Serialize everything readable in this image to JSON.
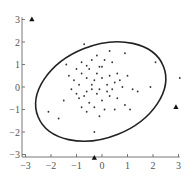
{
  "chart_data": {
    "type": "scatter",
    "title": "",
    "xlabel": "",
    "ylabel": "",
    "xlim": [
      -3.1,
      3.1
    ],
    "ylim": [
      -3.2,
      3.1
    ],
    "grid": false,
    "x_ticks": [
      -3,
      -2,
      -1,
      0,
      1,
      2,
      3
    ],
    "y_ticks": [
      -3,
      -2,
      -1,
      0,
      1,
      2,
      3
    ],
    "x_tick_labels": [
      "−3",
      "−2",
      "−1",
      "0",
      "1",
      "2",
      "3"
    ],
    "y_tick_labels": [
      "−3",
      "−2",
      "−1",
      "0",
      "1",
      "2",
      "3"
    ],
    "ellipse": {
      "center": [
        -0.05,
        -0.2
      ],
      "semi_major": 2.65,
      "semi_minor": 2.05,
      "angle_deg": 22,
      "description": "confidence ellipse"
    },
    "series": [
      {
        "name": "inliers",
        "marker": "dot",
        "points": [
          [
            -0.7,
            1.9
          ],
          [
            -0.2,
            1.4
          ],
          [
            -1.4,
            1.0
          ],
          [
            -0.8,
            1.1
          ],
          [
            -0.6,
            0.95
          ],
          [
            -1.0,
            0.8
          ],
          [
            -0.5,
            0.8
          ],
          [
            -1.3,
            0.5
          ],
          [
            -1.1,
            0.3
          ],
          [
            -0.6,
            0.4
          ],
          [
            -0.3,
            0.3
          ],
          [
            -0.9,
            0.1
          ],
          [
            -1.0,
            -0.3
          ],
          [
            -0.7,
            -0.4
          ],
          [
            -0.4,
            -0.1
          ],
          [
            -0.2,
            0.6
          ],
          [
            -0.1,
            0.9
          ],
          [
            0.1,
            1.2
          ],
          [
            0.4,
            1.1
          ],
          [
            0.6,
            0.6
          ],
          [
            0.0,
            0.4
          ],
          [
            0.2,
            0.1
          ],
          [
            0.5,
            0.2
          ],
          [
            0.8,
            0.0
          ],
          [
            1.2,
            -0.1
          ],
          [
            1.4,
            -0.2
          ],
          [
            2.1,
            1.1
          ],
          [
            0.3,
            1.6
          ],
          [
            -0.4,
            1.2
          ],
          [
            0.9,
            1.5
          ],
          [
            -0.9,
            -0.5
          ],
          [
            -0.5,
            -0.7
          ],
          [
            -0.3,
            -0.9
          ],
          [
            0.0,
            -0.6
          ],
          [
            0.3,
            -0.4
          ],
          [
            0.6,
            -0.5
          ],
          [
            0.9,
            -0.8
          ],
          [
            -0.1,
            -1.3
          ],
          [
            0.1,
            -1.0
          ],
          [
            0.5,
            -1.0
          ],
          [
            -2.1,
            -1.1
          ],
          [
            -1.7,
            -1.4
          ],
          [
            -0.8,
            -0.9
          ],
          [
            -0.6,
            -1.1
          ],
          [
            -0.2,
            -0.3
          ],
          [
            0.2,
            -0.2
          ],
          [
            0.7,
            0.3
          ],
          [
            1.0,
            0.5
          ],
          [
            -0.4,
            0.1
          ],
          [
            -0.8,
            0.6
          ],
          [
            -0.1,
            -0.1
          ],
          [
            0.4,
            -0.1
          ],
          [
            1.9,
            0.0
          ],
          [
            -0.3,
            -2.0
          ],
          [
            1.1,
            -1.0
          ],
          [
            -0.6,
            -0.2
          ],
          [
            0.0,
            0.9
          ],
          [
            0.3,
            0.5
          ],
          [
            -1.2,
            -0.1
          ],
          [
            -1.5,
            -0.6
          ],
          [
            3.05,
            0.4
          ]
        ]
      },
      {
        "name": "outliers",
        "marker": "triangle",
        "points": [
          [
            -2.75,
            3.0
          ],
          [
            2.9,
            -0.9
          ],
          [
            -0.3,
            -3.15
          ]
        ]
      }
    ]
  }
}
